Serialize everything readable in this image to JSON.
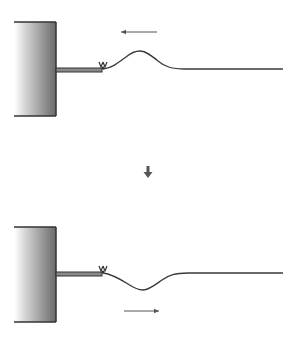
{
  "diagram": {
    "colors": {
      "line": "#3a3a3a",
      "wall_dark": "#4a4a4a",
      "wall_light": "#ffffff",
      "arrow": "#555555"
    },
    "panels": [
      {
        "id": "incident",
        "wall": {
          "x": 14,
          "y": 22,
          "width": 42,
          "height": 94
        },
        "rod": {
          "x1": 56,
          "x2": 102,
          "y": 70
        },
        "pulse": {
          "type": "crest",
          "peak_x": 140,
          "peak_y": 52,
          "baseline_y": 69,
          "end_x": 283
        },
        "direction_arrow": {
          "label": "leftward",
          "x1": 157,
          "x2": 120,
          "y": 32
        }
      },
      {
        "id": "reflected",
        "wall": {
          "x": 14,
          "y": 227,
          "width": 42,
          "height": 95
        },
        "rod": {
          "x1": 56,
          "x2": 102,
          "y": 274
        },
        "pulse": {
          "type": "trough",
          "peak_x": 143,
          "peak_y": 290,
          "baseline_y": 273,
          "end_x": 283
        },
        "direction_arrow": {
          "label": "rightward",
          "x1": 124,
          "x2": 160,
          "y": 311
        }
      }
    ],
    "transition_arrow": {
      "label": "downward",
      "x": 148,
      "y1": 166,
      "y2": 178
    }
  }
}
